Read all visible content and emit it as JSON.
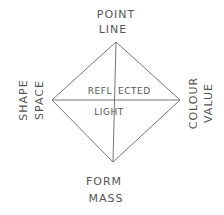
{
  "diagram": {
    "top": {
      "line1": "POINT",
      "line2": "LINE"
    },
    "left": {
      "line1": "SHAPE",
      "line2": "SPACE"
    },
    "right": {
      "line1": "COLOUR",
      "line2": "VALUE"
    },
    "bottom": {
      "line1": "FORM",
      "line2": "MASS"
    },
    "center": {
      "line1_a": "REFL",
      "line1_b": "ECTED",
      "line2": "LIGHT"
    },
    "stroke_color": "#777777",
    "text_color": "#555555"
  }
}
